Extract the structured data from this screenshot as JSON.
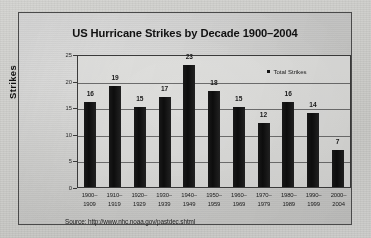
{
  "chart_data": {
    "type": "bar",
    "title": "US Hurricane Strikes by Decade 1900–2004",
    "xlabel": "",
    "ylabel": "Strikes",
    "ylim": [
      0,
      25
    ],
    "yticks": [
      0,
      5,
      10,
      15,
      20,
      25
    ],
    "grid": true,
    "legend_position": "top-right",
    "legend": [
      "Total Strikes"
    ],
    "categories": [
      "1900–1909",
      "1910–1919",
      "1920–1929",
      "1930–1939",
      "1940–1949",
      "1950–1959",
      "1960–1969",
      "1970–1979",
      "1980–1989",
      "1990–1999",
      "2000–2004"
    ],
    "category_lines": [
      [
        "1900–",
        "1909"
      ],
      [
        "1910–",
        "1919"
      ],
      [
        "1920–",
        "1929"
      ],
      [
        "1930–",
        "1939"
      ],
      [
        "1940–",
        "1949"
      ],
      [
        "1950–",
        "1959"
      ],
      [
        "1960–",
        "1969"
      ],
      [
        "1970–",
        "1979"
      ],
      [
        "1980–",
        "1989"
      ],
      [
        "1990–",
        "1999"
      ],
      [
        "2000–",
        "2004"
      ]
    ],
    "series": [
      {
        "name": "Total Strikes",
        "values": [
          16,
          19,
          15,
          17,
          23,
          18,
          15,
          12,
          16,
          14,
          7
        ]
      }
    ],
    "data_labels": [
      "16",
      "19",
      "15",
      "17",
      "23",
      "18",
      "15",
      "12",
      "16",
      "14",
      "7"
    ],
    "colors": {
      "bar": "#141414",
      "grid": "#6e6e6e",
      "axis": "#3c3c3c",
      "text": "#1a1a1a",
      "plot_background": "#dedede",
      "page_background": "#cfcfcc"
    }
  },
  "source": {
    "text": "Source: http://www.nhc.noaa.gov/pastdec.shtml"
  },
  "yticks_labels": [
    "0",
    "5",
    "10",
    "15",
    "20",
    "25"
  ]
}
